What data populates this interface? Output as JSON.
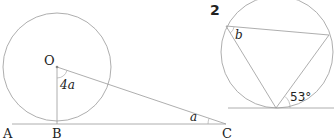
{
  "figure1": {
    "points": {
      "A": "A",
      "B": "B",
      "C": "C",
      "O": "O"
    },
    "angle_at_O": "4a",
    "angle_at_C": "a"
  },
  "figure2": {
    "number": "2",
    "angle_b": "b",
    "angle_given": "53°"
  }
}
